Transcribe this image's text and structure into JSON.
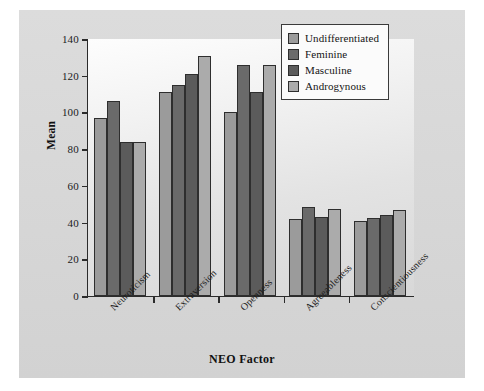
{
  "chart_data": {
    "type": "bar",
    "title": "",
    "xlabel": "NEO Factor",
    "ylabel": "Mean",
    "ylim": [
      0,
      140
    ],
    "ytick_values": [
      0,
      20,
      40,
      60,
      80,
      100,
      120,
      140
    ],
    "ytick_labels": [
      "0",
      "20",
      "40",
      "60",
      "80",
      "100",
      "120",
      "140"
    ],
    "grid": false,
    "legend_position": "top-right",
    "categories": [
      "Neuroticism",
      "Extraversion",
      "Openness",
      "Agreeableness",
      "Conscientiousness"
    ],
    "series": [
      {
        "name": "Undifferentiated",
        "color": "#9b9b9b",
        "values": [
          97,
          111,
          100,
          42,
          41
        ]
      },
      {
        "name": "Feminine",
        "color": "#6a6a6a",
        "values": [
          106,
          115,
          126,
          48.5,
          42.5
        ]
      },
      {
        "name": "Masculine",
        "color": "#5b5b5b",
        "values": [
          84,
          121,
          111,
          43,
          44
        ]
      },
      {
        "name": "Androgynous",
        "color": "#ababab",
        "values": [
          84,
          131,
          126,
          47.5,
          47
        ]
      }
    ]
  },
  "legend": {
    "entries": [
      {
        "label": "Undifferentiated",
        "color": "#9b9b9b"
      },
      {
        "label": "Feminine",
        "color": "#6a6a6a"
      },
      {
        "label": "Masculine",
        "color": "#5b5b5b"
      },
      {
        "label": "Androgynous",
        "color": "#ababab"
      }
    ]
  },
  "colors": {
    "page_background": "#ffffff",
    "figure_background": "#d9d9d9",
    "plot_background": "#f0f0f0",
    "axis": "#2b2b2b",
    "text": "#141414"
  }
}
